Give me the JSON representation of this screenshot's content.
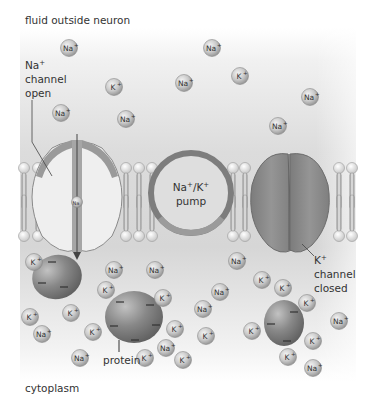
{
  "diagram": {
    "title_outside": "fluid outside neuron",
    "title_inside": "cytoplasm",
    "colors": {
      "background_gray": "#d4d4d4",
      "membrane_head": "#f4f4f4",
      "channel_fill": "#efefef",
      "channel_rim": "#8a8a8a",
      "pump_ring": "#7d7d7d",
      "k_channel": "#8c8c8c",
      "protein": "#7e7e7e",
      "ion_fill": "#c8c8c8",
      "text": "#333333"
    },
    "labels": {
      "na_channel": [
        "Na",
        "+",
        "channel",
        "open"
      ],
      "pump": [
        "Na",
        "+",
        "/K",
        "+",
        "pump"
      ],
      "k_channel": [
        "K",
        "+",
        "channel",
        "closed"
      ],
      "protein": "protein"
    },
    "ions_outside": [
      {
        "type": "Na",
        "x": 69,
        "y": 48
      },
      {
        "type": "Na",
        "x": 212,
        "y": 48
      },
      {
        "type": "K",
        "x": 114,
        "y": 87
      },
      {
        "type": "K",
        "x": 240,
        "y": 76
      },
      {
        "type": "Na",
        "x": 184,
        "y": 83
      },
      {
        "type": "Na",
        "x": 310,
        "y": 97
      },
      {
        "type": "Na",
        "x": 61,
        "y": 113
      },
      {
        "type": "Na",
        "x": 126,
        "y": 119
      },
      {
        "type": "Na",
        "x": 278,
        "y": 126
      }
    ],
    "ions_inside": [
      {
        "type": "K",
        "x": 34,
        "y": 262
      },
      {
        "type": "Na",
        "x": 114,
        "y": 270
      },
      {
        "type": "Na",
        "x": 155,
        "y": 270
      },
      {
        "type": "Na",
        "x": 237,
        "y": 261
      },
      {
        "type": "K",
        "x": 106,
        "y": 290
      },
      {
        "type": "K",
        "x": 163,
        "y": 298
      },
      {
        "type": "K",
        "x": 262,
        "y": 280
      },
      {
        "type": "Na",
        "x": 220,
        "y": 292
      },
      {
        "type": "K",
        "x": 283,
        "y": 288
      },
      {
        "type": "K",
        "x": 30,
        "y": 317
      },
      {
        "type": "K",
        "x": 71,
        "y": 313
      },
      {
        "type": "K",
        "x": 175,
        "y": 329
      },
      {
        "type": "K",
        "x": 307,
        "y": 303
      },
      {
        "type": "Na",
        "x": 339,
        "y": 321
      },
      {
        "type": "Na",
        "x": 42,
        "y": 334
      },
      {
        "type": "K",
        "x": 93,
        "y": 332
      },
      {
        "type": "Na",
        "x": 166,
        "y": 348
      },
      {
        "type": "K",
        "x": 252,
        "y": 331
      },
      {
        "type": "K",
        "x": 313,
        "y": 341
      },
      {
        "type": "Na",
        "x": 80,
        "y": 358
      },
      {
        "type": "K",
        "x": 145,
        "y": 358
      },
      {
        "type": "K",
        "x": 183,
        "y": 360
      },
      {
        "type": "K",
        "x": 206,
        "y": 336
      },
      {
        "type": "Na",
        "x": 203,
        "y": 309
      },
      {
        "type": "K",
        "x": 288,
        "y": 357
      },
      {
        "type": "Na",
        "x": 313,
        "y": 368
      }
    ],
    "channel_ion": {
      "type": "Na",
      "x": 77,
      "y": 202
    }
  }
}
